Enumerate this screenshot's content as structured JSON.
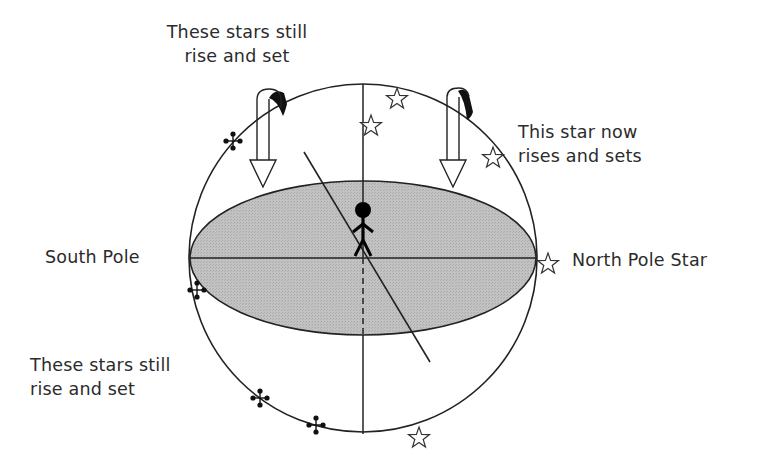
{
  "labels": {
    "top_left_line1": "These stars still",
    "top_left_line2": "rise and set",
    "top_right_line1": "This star now",
    "top_right_line2": "rises and sets",
    "south_pole": "South Pole",
    "north_pole_star": "North Pole Star",
    "bottom_left_line1": "These stars still",
    "bottom_left_line2": "rise and set"
  },
  "colors": {
    "line": "#222222",
    "horizon_fill": "#bdbdbd",
    "background": "#ffffff"
  },
  "sphere": {
    "cx": 363,
    "cy": 258,
    "r": 174
  },
  "horizon_plane": {
    "cx": 363,
    "cy": 258,
    "rx": 173,
    "ry": 77
  },
  "tilted_axis": {
    "x1": 304,
    "y1": 152,
    "x2": 430,
    "y2": 362
  },
  "observer": {
    "x": 363,
    "y": 210
  },
  "rotation_arrows": [
    {
      "id": "left",
      "x": 263,
      "y_top": 92,
      "y_tip": 187
    },
    {
      "id": "right",
      "x": 453,
      "y_top": 89,
      "y_tip": 187
    }
  ],
  "open_stars": [
    {
      "x": 397,
      "y": 99
    },
    {
      "x": 371,
      "y": 126
    },
    {
      "x": 493,
      "y": 158
    },
    {
      "x": 548,
      "y": 264
    },
    {
      "x": 419,
      "y": 438
    }
  ],
  "dot_clusters": [
    {
      "x": 233,
      "y": 141
    },
    {
      "x": 197,
      "y": 290
    },
    {
      "x": 260,
      "y": 398
    },
    {
      "x": 316,
      "y": 425
    }
  ]
}
